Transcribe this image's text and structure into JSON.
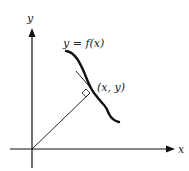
{
  "diagram": {
    "type": "geometry-figure",
    "colors": {
      "stroke": "#111111",
      "background": "#ffffff",
      "text": "#222222"
    },
    "axes": {
      "x_label": "x",
      "y_label": "y"
    },
    "labels": {
      "curve": "y = f(x)",
      "point": "(x, y)"
    },
    "annotations": {
      "right_angle_marker": "perpendicular"
    }
  }
}
